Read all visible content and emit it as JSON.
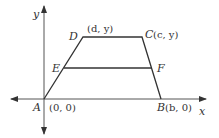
{
  "diagram": {
    "axes": {
      "x_label": "x",
      "y_label": "y"
    },
    "points": {
      "A": {
        "name": "A",
        "coord": "(0, 0)"
      },
      "B": {
        "name": "B",
        "coord": "(b, 0)"
      },
      "C": {
        "name": "C",
        "coord": "(c, y)"
      },
      "D": {
        "name": "D",
        "coord": "(d, y)"
      },
      "E": {
        "name": "E"
      },
      "F": {
        "name": "F"
      }
    },
    "colors": {
      "line": "#333333",
      "axis": "#555555"
    }
  }
}
